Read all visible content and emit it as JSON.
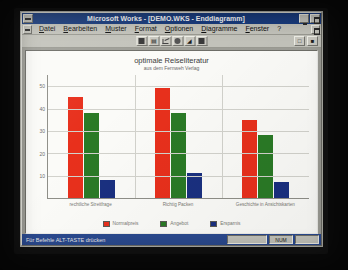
{
  "window": {
    "title": "Microsoft Works - [DEMO.WKS - Enddiagramm]",
    "sysmenu_label": "system-menu",
    "minimize_label": "Minimieren",
    "maximize_label": "Maximieren",
    "doc_sysmenu_label": "document-system-menu",
    "doc_restore_label": "Wiederherstellen"
  },
  "menubar": {
    "items": [
      {
        "label": "Datei",
        "accel": "D"
      },
      {
        "label": "Bearbeiten",
        "accel": "B"
      },
      {
        "label": "Muster",
        "accel": "M"
      },
      {
        "label": "Format",
        "accel": "F"
      },
      {
        "label": "Optionen",
        "accel": "O"
      },
      {
        "label": "Diagramme",
        "accel": "D"
      },
      {
        "label": "Fenster",
        "accel": "F"
      },
      {
        "label": "?",
        "accel": "?"
      }
    ]
  },
  "toolbar": {
    "buttons": [
      {
        "name": "bar-chart-button",
        "glyph": "bar"
      },
      {
        "name": "stacked-bar-chart-button",
        "glyph": "stack"
      },
      {
        "name": "line-chart-button",
        "glyph": "line"
      },
      {
        "name": "pie-chart-button",
        "glyph": "pie"
      },
      {
        "name": "area-chart-button",
        "glyph": "area"
      },
      {
        "name": "combo-chart-button",
        "glyph": "combo"
      }
    ],
    "right_buttons": [
      {
        "name": "zoom-out-button",
        "glyph": "zoom-out"
      },
      {
        "name": "zoom-in-button",
        "glyph": "zoom-in"
      }
    ]
  },
  "chart_data": {
    "type": "bar",
    "title": "optimale Reiseliteratur",
    "subtitle": "aus dem Fernweh Verlag",
    "xlabel": "",
    "ylabel": "",
    "ylim": [
      0,
      55
    ],
    "yticks": [
      50,
      40,
      30,
      20,
      10
    ],
    "grid": true,
    "legend_position": "bottom",
    "categories": [
      "rechtliche Streitfrage",
      "Richtig Packen",
      "Geschichte in Ansichtskarten"
    ],
    "series": [
      {
        "name": "Normalpreis",
        "color": "#e8301c",
        "values": [
          45,
          49,
          35
        ]
      },
      {
        "name": "Angebot",
        "color": "#2a7a26",
        "values": [
          38,
          38,
          28
        ]
      },
      {
        "name": "Ersparnis",
        "color": "#1a3080",
        "values": [
          8,
          11,
          7
        ]
      }
    ]
  },
  "statusbar": {
    "message": "Für Befehle ALT-TASTE drücken",
    "cells": [
      "",
      "NUM",
      ""
    ]
  }
}
